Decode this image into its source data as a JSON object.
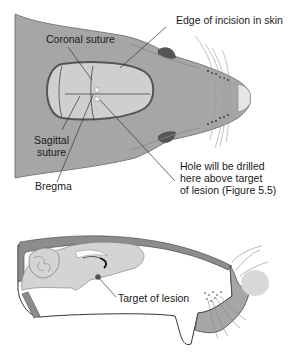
{
  "figure": {
    "top_view": {
      "labels": {
        "edge_of_incision": "Edge of incision in skin",
        "coronal_suture": "Coronal suture",
        "sagittal_suture_line1": "Sagittal",
        "sagittal_suture_line2": "suture",
        "bregma": "Bregma",
        "hole_line1": "Hole will be drilled",
        "hole_line2": "here above target",
        "hole_line3": "of lesion (Figure 5.5)"
      }
    },
    "side_view": {
      "labels": {
        "target_of_lesion": "Target of lesion"
      }
    },
    "colors": {
      "head_fill": "#a6a6a6",
      "skull_fill": "#cfcfcf",
      "outline": "#4a4a4a",
      "ear": "#555555",
      "nose": "#e6e6e6",
      "brain_fill": "#d4d4d4",
      "bone": "#8c8c8c"
    }
  }
}
